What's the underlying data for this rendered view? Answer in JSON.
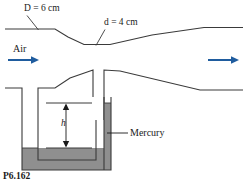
{
  "figure": {
    "caption": "P6.162",
    "labels": {
      "upstream_diameter": "D = 6 cm",
      "throat_diameter": "d = 4 cm",
      "fluid": "Air",
      "manometer_height": "h",
      "manometer_fluid": "Mercury"
    },
    "colors": {
      "line": "#3a3a3a",
      "arrow": "#1f5c9e",
      "mercury_fill": "#8f8f8f",
      "background": "#ffffff",
      "text": "#1a1a1a"
    },
    "geometry": {
      "upper_pipe_top_y": 29,
      "throat_top_y": 44,
      "lower_pipe_y": 88,
      "manometer_left_tube_x": 38,
      "manometer_right_tube_x": 104,
      "mercury_level_high_y": 103,
      "mercury_level_low_y": 148
    }
  }
}
